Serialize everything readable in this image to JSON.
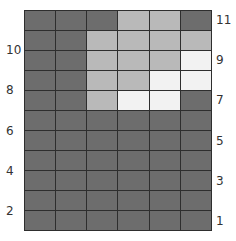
{
  "colors": {
    "dark": "#6d6d6d",
    "light": "#b9b9b9",
    "white": "#f2f2f2",
    "grid_line": "#2e2e2e"
  },
  "grid": {
    "columns": 6,
    "rows": 11,
    "cells": [
      [
        "dark",
        "dark",
        "dark",
        "light",
        "light",
        "dark"
      ],
      [
        "dark",
        "dark",
        "light",
        "light",
        "light",
        "light"
      ],
      [
        "dark",
        "dark",
        "light",
        "light",
        "light",
        "white"
      ],
      [
        "dark",
        "dark",
        "light",
        "light",
        "white",
        "white"
      ],
      [
        "dark",
        "dark",
        "light",
        "white",
        "white",
        "dark"
      ],
      [
        "dark",
        "dark",
        "dark",
        "dark",
        "dark",
        "dark"
      ],
      [
        "dark",
        "dark",
        "dark",
        "dark",
        "dark",
        "dark"
      ],
      [
        "dark",
        "dark",
        "dark",
        "dark",
        "dark",
        "dark"
      ],
      [
        "dark",
        "dark",
        "dark",
        "dark",
        "dark",
        "dark"
      ],
      [
        "dark",
        "dark",
        "dark",
        "dark",
        "dark",
        "dark"
      ],
      [
        "dark",
        "dark",
        "dark",
        "dark",
        "dark",
        "dark"
      ]
    ]
  },
  "left_labels": [
    {
      "text": "10",
      "row_from_top": 1
    },
    {
      "text": "8",
      "row_from_top": 3
    },
    {
      "text": "6",
      "row_from_top": 5
    },
    {
      "text": "4",
      "row_from_top": 7
    },
    {
      "text": "2",
      "row_from_top": 9
    }
  ],
  "right_labels": [
    {
      "text": "11",
      "row_from_top": 0
    },
    {
      "text": "9",
      "row_from_top": 2
    },
    {
      "text": "7",
      "row_from_top": 4
    },
    {
      "text": "5",
      "row_from_top": 6
    },
    {
      "text": "3",
      "row_from_top": 8
    },
    {
      "text": "1",
      "row_from_top": 10
    }
  ]
}
